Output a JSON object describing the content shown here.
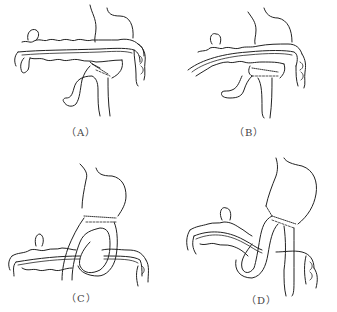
{
  "figure": {
    "panels": [
      {
        "id": "A",
        "label": "（A）"
      },
      {
        "id": "B",
        "label": "（B）"
      },
      {
        "id": "C",
        "label": "（C）"
      },
      {
        "id": "D",
        "label": "（D）"
      }
    ]
  }
}
